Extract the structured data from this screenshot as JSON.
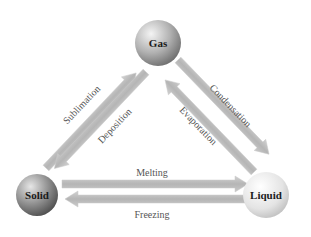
{
  "diagram": {
    "states": {
      "gas": {
        "label": "Gas"
      },
      "solid": {
        "label": "Solid"
      },
      "liquid": {
        "label": "Liquid"
      }
    },
    "transitions": {
      "sublimation": {
        "label": "Sublimation",
        "from": "Solid",
        "to": "Gas"
      },
      "deposition": {
        "label": "Deposition",
        "from": "Gas",
        "to": "Solid"
      },
      "condensation": {
        "label": "Condensation",
        "from": "Gas",
        "to": "Liquid"
      },
      "evaporation": {
        "label": "Evaporation",
        "from": "Liquid",
        "to": "Gas"
      },
      "melting": {
        "label": "Melting",
        "from": "Solid",
        "to": "Liquid"
      },
      "freezing": {
        "label": "Freezing",
        "from": "Liquid",
        "to": "Solid"
      }
    },
    "colors": {
      "arrow_fill": "#b9b9b9",
      "arrow_edge": "#cfcfcf",
      "gas_sphere": "#a8a8a8",
      "solid_sphere": "#8c8c8c",
      "liquid_sphere": "#e2e2e2",
      "label_text": "#555555"
    }
  }
}
